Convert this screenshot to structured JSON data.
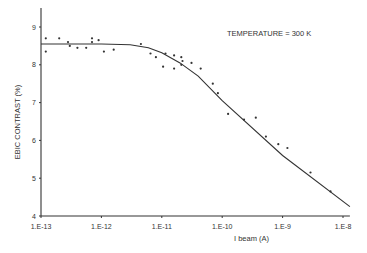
{
  "chart_data": {
    "type": "scatter",
    "title": "",
    "annotation": "TEMPERATURE = 300 K",
    "xlabel": "I beam (A)",
    "ylabel": "EBIC CONTRAST (%)",
    "xscale": "log",
    "xlim": [
      1e-13,
      1.3e-08
    ],
    "ylim": [
      4,
      9.5
    ],
    "xticks": [
      "1.E-13",
      "1.E-12",
      "1.E-11",
      "1.E-10",
      "1.E-9",
      "1.E-8"
    ],
    "yticks": [
      "4",
      "5",
      "6",
      "7",
      "8",
      "9"
    ],
    "grid": false,
    "legend": "none",
    "series": [
      {
        "name": "measured",
        "kind": "points",
        "x": [
          1.2e-13,
          1.2e-13,
          2e-13,
          2.8e-13,
          3e-13,
          4e-13,
          5.6e-13,
          7e-13,
          7e-13,
          9e-13,
          1.1e-12,
          1.6e-12,
          4.5e-12,
          6.5e-12,
          8e-12,
          1.15e-11,
          1.05e-11,
          1.6e-11,
          1.6e-11,
          2.1e-11,
          2.1e-11,
          2.2e-11,
          3.1e-11,
          4.4e-11,
          7e-11,
          8.5e-11,
          1.25e-10,
          2.3e-10,
          3.6e-10,
          5.3e-10,
          8.5e-10,
          1.2e-09,
          2.9e-09,
          6.2e-09
        ],
        "y": [
          8.7,
          8.35,
          8.7,
          8.6,
          8.5,
          8.45,
          8.45,
          8.7,
          8.6,
          8.65,
          8.35,
          8.4,
          8.55,
          8.3,
          8.2,
          8.3,
          7.95,
          8.25,
          7.9,
          8.2,
          8.0,
          8.1,
          8.05,
          7.9,
          7.5,
          7.25,
          6.7,
          6.55,
          6.6,
          6.1,
          5.9,
          5.8,
          5.15,
          4.65
        ]
      },
      {
        "name": "fit",
        "kind": "line",
        "x": [
          1e-13,
          1e-12,
          3e-12,
          6e-12,
          1e-11,
          2e-11,
          4e-11,
          1e-10,
          1e-09,
          1.3e-08
        ],
        "y": [
          8.55,
          8.55,
          8.53,
          8.45,
          8.32,
          8.05,
          7.7,
          7.05,
          5.6,
          4.25
        ]
      }
    ]
  }
}
